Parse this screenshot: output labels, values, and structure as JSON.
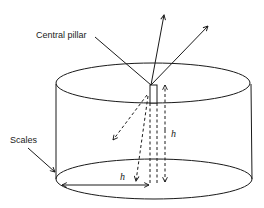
{
  "diagram": {
    "labels": {
      "central_pillar": "Central pillar",
      "scales": "Scales",
      "h_vertical": "h",
      "h_horizontal": "h"
    },
    "colors": {
      "stroke": "#1a1a1a",
      "background": "#ffffff"
    },
    "shapes": {
      "cylinder": {
        "top_ellipse": {
          "cx": 153,
          "cy": 83,
          "rx": 97,
          "ry": 20
        },
        "bottom_ellipse": {
          "cx": 154,
          "cy": 179,
          "rx": 98,
          "ry": 20
        }
      },
      "pillar": {
        "x": 150,
        "y": 85,
        "w": 7,
        "h": 18
      }
    }
  }
}
